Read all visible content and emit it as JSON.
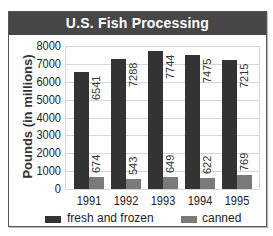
{
  "chart_data": {
    "type": "bar",
    "title": "U.S. Fish Processing",
    "xlabel": "",
    "ylabel": "Pounds (in millions)",
    "ylim": [
      0,
      8000
    ],
    "yticks": [
      "0",
      "1000",
      "2000",
      "3000",
      "4000",
      "5000",
      "6000",
      "7000",
      "8000"
    ],
    "categories": [
      "1991",
      "1992",
      "1993",
      "1994",
      "1995"
    ],
    "series": [
      {
        "name": "fresh and frozen",
        "color": "#333333",
        "values": [
          6541,
          7288,
          7744,
          7475,
          7215
        ],
        "labels": [
          "6541",
          "7288",
          "7744",
          "7475",
          "7215"
        ]
      },
      {
        "name": "canned",
        "color": "#7a7a7a",
        "values": [
          674,
          543,
          649,
          622,
          769
        ],
        "labels": [
          "674",
          "543",
          "649",
          "622",
          "769"
        ]
      }
    ],
    "grid": true,
    "legend_position": "bottom",
    "data_labels": "rotated vertical, inside/above bars"
  }
}
